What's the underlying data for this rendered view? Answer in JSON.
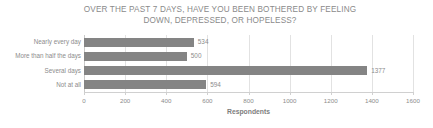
{
  "chart_data": {
    "type": "bar",
    "orientation": "horizontal",
    "title": "OVER THE PAST 7 DAYS, HAVE YOU BEEN BOTHERED BY FEELING DOWN, DEPRESSED, OR HOPELESS?",
    "title_line1": "OVER THE PAST 7 DAYS, HAVE YOU BEEN BOTHERED BY FEELING",
    "title_line2": "DOWN, DEPRESSED, OR HOPELESS?",
    "categories": [
      "Nearly every day",
      "More than half the days",
      "Several days",
      "Not at all"
    ],
    "values": [
      534,
      500,
      1377,
      594
    ],
    "value_labels": [
      "534",
      "500",
      "1377",
      "594"
    ],
    "xlabel": "Respondents",
    "ylabel": "",
    "xlim": [
      0,
      1600
    ],
    "xticks": [
      0,
      200,
      400,
      600,
      800,
      1000,
      1200,
      1400,
      1600
    ],
    "xtick_labels": [
      "0",
      "200",
      "400",
      "600",
      "800",
      "1000",
      "1200",
      "1400",
      "1600"
    ],
    "grid": true,
    "grid_axis": "x",
    "legend": false,
    "bar_color": "#848484",
    "text_color": "#8c8c8c",
    "grid_color": "#e2e2e2",
    "background": "#ffffff"
  }
}
